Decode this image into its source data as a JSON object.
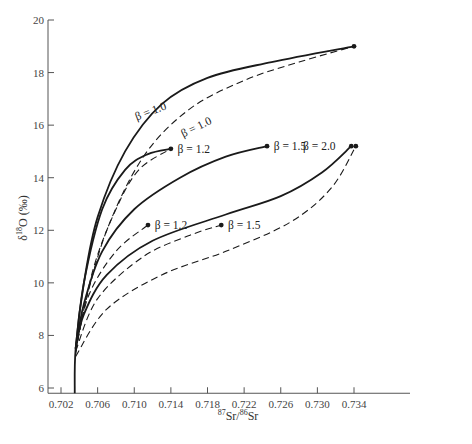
{
  "chart_data": {
    "type": "line",
    "title": "",
    "xlabel": "87Sr/86Sr",
    "xlabel_parts": {
      "sup1": "87",
      "base1": "Sr/",
      "sup2": "86",
      "base2": "Sr"
    },
    "ylabel": "δ18O (‰)",
    "ylabel_parts": {
      "pre": "δ",
      "sup": "18",
      "post": "O (‰)"
    },
    "xlim": [
      0.7015,
      0.7385
    ],
    "ylim": [
      5.8,
      20
    ],
    "x_ticks": [
      "0.702",
      "0.706",
      "0.710",
      "0.714",
      "0.718",
      "0.722",
      "0.726",
      "0.730",
      "0.734"
    ],
    "y_ticks": [
      "6",
      "8",
      "10",
      "12",
      "14",
      "16",
      "18",
      "20"
    ],
    "grid": false,
    "legend": "none (curves annotated inline)",
    "series": [
      {
        "name": "β = 1.0",
        "style": "solid",
        "points": [
          [
            0.7035,
            5.8
          ],
          [
            0.7036,
            7.5
          ],
          [
            0.7045,
            10.0
          ],
          [
            0.706,
            12.5
          ],
          [
            0.709,
            15.0
          ],
          [
            0.713,
            16.8
          ],
          [
            0.718,
            17.8
          ],
          [
            0.725,
            18.4
          ],
          [
            0.734,
            19.0
          ]
        ],
        "endpoint_marker": true
      },
      {
        "name": "β = 1.0",
        "style": "dashed",
        "points": [
          [
            0.7036,
            7.3
          ],
          [
            0.7045,
            9.0
          ],
          [
            0.707,
            12.0
          ],
          [
            0.711,
            14.8
          ],
          [
            0.716,
            16.6
          ],
          [
            0.722,
            17.7
          ],
          [
            0.728,
            18.4
          ],
          [
            0.734,
            19.0
          ]
        ],
        "endpoint_marker": false
      },
      {
        "name": "β = 1.2",
        "style": "solid",
        "points": [
          [
            0.7036,
            7.5
          ],
          [
            0.7045,
            10.0
          ],
          [
            0.7065,
            12.8
          ],
          [
            0.709,
            14.3
          ],
          [
            0.7115,
            14.9
          ],
          [
            0.714,
            15.1
          ]
        ],
        "endpoint_marker": true
      },
      {
        "name": "β = 1.2",
        "style": "dashed",
        "points": [
          [
            0.7036,
            7.4
          ],
          [
            0.7055,
            10.5
          ],
          [
            0.708,
            12.8
          ],
          [
            0.7105,
            14.3
          ],
          [
            0.714,
            15.1
          ]
        ],
        "endpoint_marker": false
      },
      {
        "name": "β = 1.5",
        "style": "solid",
        "points": [
          [
            0.7036,
            7.5
          ],
          [
            0.7045,
            9.2
          ],
          [
            0.7065,
            11.2
          ],
          [
            0.71,
            12.8
          ],
          [
            0.715,
            14.0
          ],
          [
            0.72,
            14.8
          ],
          [
            0.7245,
            15.2
          ]
        ],
        "endpoint_marker": true
      },
      {
        "name": "β = 1.2",
        "style": "dashed",
        "points": [
          [
            0.7036,
            7.4
          ],
          [
            0.705,
            9.5
          ],
          [
            0.708,
            11.2
          ],
          [
            0.7115,
            12.2
          ]
        ],
        "endpoint_marker": true
      },
      {
        "name": "β = 2.0",
        "style": "solid",
        "points": [
          [
            0.7036,
            7.5
          ],
          [
            0.7045,
            8.8
          ],
          [
            0.707,
            10.3
          ],
          [
            0.712,
            11.6
          ],
          [
            0.72,
            12.6
          ],
          [
            0.726,
            13.3
          ],
          [
            0.7305,
            14.2
          ],
          [
            0.7337,
            15.2
          ]
        ],
        "endpoint_marker": true
      },
      {
        "name": "β = 1.5",
        "style": "dashed",
        "points": [
          [
            0.7036,
            7.4
          ],
          [
            0.706,
            9.4
          ],
          [
            0.711,
            11.0
          ],
          [
            0.716,
            11.8
          ],
          [
            0.7195,
            12.2
          ]
        ],
        "endpoint_marker": true
      },
      {
        "name": "β = 2.0 (lower)",
        "style": "dashed",
        "points": [
          [
            0.7036,
            7.2
          ],
          [
            0.707,
            9.0
          ],
          [
            0.713,
            10.3
          ],
          [
            0.72,
            11.2
          ],
          [
            0.727,
            12.3
          ],
          [
            0.7315,
            13.6
          ],
          [
            0.7342,
            15.2
          ]
        ],
        "endpoint_marker": true
      }
    ],
    "annotations": [
      {
        "text": "β = 1.0",
        "x": 0.7115,
        "y": 16.55,
        "rotate": -21
      },
      {
        "text": "β = 1.0",
        "x": 0.7165,
        "y": 15.95,
        "rotate": -26
      },
      {
        "text": "β = 1.2",
        "x": 0.7143,
        "y": 15.1
      },
      {
        "text": "β = 1.5",
        "x": 0.7248,
        "y": 15.2
      },
      {
        "text": "β = 2.0",
        "x": 0.728,
        "y": 15.2
      },
      {
        "text": "β = 1.2",
        "x": 0.7118,
        "y": 12.2
      },
      {
        "text": "β = 1.5",
        "x": 0.7198,
        "y": 12.2
      }
    ]
  }
}
